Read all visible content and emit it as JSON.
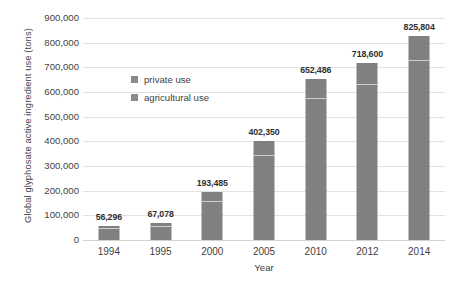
{
  "chart_data": {
    "type": "bar",
    "title": "",
    "subtitle": "",
    "xlabel": "Year",
    "ylabel": "Global glyphosate active ingredient use (tons)",
    "categories": [
      "1994",
      "1995",
      "2000",
      "2005",
      "2010",
      "2012",
      "2014"
    ],
    "values": [
      56296,
      67078,
      193485,
      402350,
      652486,
      718600,
      825804
    ],
    "data_labels": [
      "56,296",
      "67,078",
      "193,485",
      "402,350",
      "652,486",
      "718,600",
      "825,804"
    ],
    "stacked": true,
    "series": [
      {
        "name": "agricultural use",
        "values": [
          46000,
          54000,
          155000,
          340000,
          570000,
          630000,
          725000
        ]
      },
      {
        "name": "private use",
        "values": [
          10296,
          13078,
          38485,
          62350,
          82486,
          88600,
          100804
        ]
      }
    ],
    "legend": [
      "private use",
      "agricultural use"
    ],
    "legend_position": "inside-upper-left",
    "ylim": [
      0,
      900000
    ],
    "ytick_step": 100000,
    "ytick_labels": [
      "900,000",
      "800,000",
      "700,000",
      "600,000",
      "500,000",
      "400,000",
      "300,000",
      "200,000",
      "100,000",
      "0"
    ],
    "ytick_values": [
      900000,
      800000,
      700000,
      600000,
      500000,
      400000,
      300000,
      200000,
      100000,
      0
    ],
    "grid": true,
    "grid_axis": "y",
    "colors": {
      "bar": "#808080",
      "divider": "#cfcfcf",
      "gridline": "#e2e2e2",
      "baseline": "#d2d2d2",
      "text": "#3f3f3f",
      "label_text": "#2f2f2f",
      "legend_swatch": "#8a8a8a",
      "background": "#ffffff"
    }
  }
}
